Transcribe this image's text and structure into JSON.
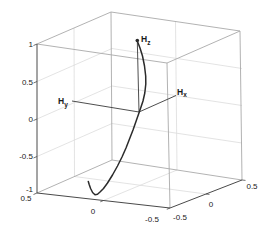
{
  "colors": {
    "background": "#ffffff",
    "curve": "#2b2b2b",
    "axis_line": "#3a3a3a",
    "dark_edge": "#4a4a4a",
    "light_edge": "#a9a9a9",
    "grid": "#dcdcdc",
    "text": "#1a1a1a"
  },
  "labels": {
    "hz": {
      "base": "H",
      "sub": "z"
    },
    "hy": {
      "base": "H",
      "sub": "y"
    },
    "hx": {
      "base": "H",
      "sub": "x"
    }
  },
  "chart_data": {
    "type": "line3d",
    "title": "",
    "grid": true,
    "axes": {
      "x": {
        "range": [
          -0.5,
          0.5
        ],
        "tick_labels": [
          "0.5",
          "0",
          "-0.5"
        ]
      },
      "y": {
        "range": [
          -0.5,
          0.5
        ],
        "tick_labels": [
          "-0.5",
          "0",
          "0.5"
        ]
      },
      "z": {
        "range": [
          -1,
          1
        ],
        "tick_labels": [
          "1",
          "0.5",
          "0",
          "-0.5",
          "-1"
        ]
      }
    },
    "annotations": [
      {
        "label": "Hz",
        "line_from_origin_to_xyz": [
          0,
          0,
          1
        ],
        "marker": "dot"
      },
      {
        "label": "Hy",
        "line_from_origin_to_xyz": [
          0.5,
          0,
          0
        ]
      },
      {
        "label": "Hx",
        "line_from_origin_to_xyz": [
          0,
          0.5,
          0
        ]
      }
    ],
    "origin_px": [
      139,
      112
    ],
    "hz_marker_px": [
      137.3,
      40.5
    ],
    "axis_lines_px": {
      "hz": [
        [
          139,
          112
        ],
        [
          137.3,
          41
        ]
      ],
      "hy": [
        [
          139,
          112
        ],
        [
          72,
          101
        ]
      ],
      "hx": [
        [
          139,
          112
        ],
        [
          176,
          95.5
        ]
      ]
    },
    "curve_points_px": [
      [
        137.3,
        41
      ],
      [
        140,
        48
      ],
      [
        142.5,
        56
      ],
      [
        144.5,
        66
      ],
      [
        145.7,
        76
      ],
      [
        145.8,
        84
      ],
      [
        144.8,
        93
      ],
      [
        143,
        101
      ],
      [
        141,
        107
      ],
      [
        139.3,
        112
      ],
      [
        136.5,
        120
      ],
      [
        133,
        130
      ],
      [
        129.5,
        139
      ],
      [
        126,
        148
      ],
      [
        122,
        157
      ],
      [
        117.5,
        166
      ],
      [
        112.5,
        175
      ],
      [
        107.5,
        183
      ],
      [
        103.5,
        188.5
      ],
      [
        100,
        192
      ],
      [
        97.5,
        194.3
      ],
      [
        95,
        194.8
      ],
      [
        92.6,
        192.5
      ],
      [
        90.6,
        188.5
      ],
      [
        89.2,
        184.5
      ],
      [
        88.3,
        181.5
      ]
    ]
  }
}
